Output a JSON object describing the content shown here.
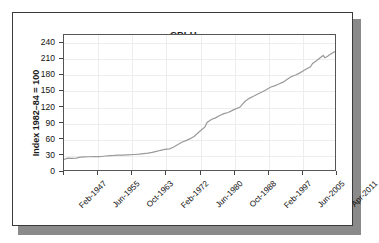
{
  "chart_data": {
    "type": "line",
    "title": "CPI-U",
    "xlabel": "",
    "ylabel": "Index 1982–84 = 100",
    "ylim": [
      0,
      255
    ],
    "yticks": [
      0,
      30,
      60,
      90,
      120,
      150,
      180,
      210,
      240
    ],
    "grid": true,
    "legend": "none",
    "line_color": "#9a9a9a",
    "xtick_labels": [
      "Feb-1947",
      "Jun-1955",
      "Oct-1963",
      "Feb-1972",
      "Jun-1980",
      "Oct-1988",
      "Feb-1997",
      "Jun-2005",
      "Apr-2011"
    ],
    "x_start": "Feb-1947",
    "x_end": "Apr-2011",
    "series": [
      {
        "name": "CPI-U",
        "x": [
          1947.1,
          1948.0,
          1949.0,
          1950.0,
          1951.0,
          1952.0,
          1953.0,
          1954.0,
          1955.5,
          1956.0,
          1957.0,
          1958.0,
          1959.0,
          1960.0,
          1961.0,
          1962.0,
          1963.8,
          1965.0,
          1966.0,
          1967.0,
          1968.0,
          1969.0,
          1970.0,
          1971.0,
          1972.1,
          1973.0,
          1974.0,
          1975.0,
          1976.0,
          1977.0,
          1978.0,
          1979.0,
          1980.5,
          1981.0,
          1982.0,
          1983.0,
          1984.0,
          1985.0,
          1986.0,
          1987.0,
          1988.8,
          1990.0,
          1991.0,
          1992.0,
          1993.0,
          1994.0,
          1995.0,
          1996.0,
          1997.1,
          1998.0,
          1999.0,
          2000.0,
          2001.0,
          2002.0,
          2003.0,
          2004.0,
          2005.5,
          2006.0,
          2007.0,
          2008.5,
          2008.9,
          2009.5,
          2010.0,
          2011.3
        ],
        "y": [
          21.9,
          24.1,
          23.8,
          24.1,
          26.0,
          26.5,
          26.7,
          26.9,
          26.8,
          27.2,
          28.1,
          28.9,
          29.1,
          29.6,
          29.9,
          30.2,
          30.9,
          31.5,
          32.4,
          33.4,
          34.8,
          36.7,
          38.8,
          40.5,
          41.4,
          44.4,
          49.3,
          53.8,
          56.9,
          60.6,
          65.2,
          72.6,
          82.7,
          90.9,
          96.5,
          99.6,
          103.9,
          107.6,
          109.6,
          113.6,
          119.8,
          130.7,
          136.2,
          140.3,
          144.5,
          148.2,
          152.4,
          156.9,
          160.0,
          163.0,
          166.6,
          172.2,
          177.1,
          179.9,
          184.0,
          188.9,
          195.3,
          201.6,
          207.3,
          216.7,
          212.4,
          214.8,
          218.1,
          224.0
        ]
      }
    ]
  }
}
